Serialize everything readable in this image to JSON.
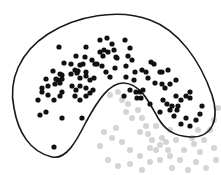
{
  "diagram": {
    "type": "scatter-with-enclosing-region",
    "background": "#ffffff",
    "outline_color": "#1a1a1a",
    "inside_dot_color": "#111111",
    "outside_dot_color": "#d4d4d4",
    "region_path": "M 14 108 C 8 80, 20 52, 48 34 C 76 16, 118 8, 150 20 C 178 30, 200 60, 212 95 C 220 120, 212 138, 190 137 C 172 136, 164 128, 158 118 C 148 100, 140 84, 124 83 C 110 82, 98 100, 86 122 C 76 142, 66 160, 52 157 C 30 152, 18 132, 14 108 Z",
    "inside_points": [
      [
        59,
        47
      ],
      [
        86,
        47
      ],
      [
        76,
        56
      ],
      [
        64,
        63
      ],
      [
        71,
        64
      ],
      [
        85,
        57
      ],
      [
        92,
        60
      ],
      [
        95,
        64
      ],
      [
        80,
        65
      ],
      [
        75,
        70
      ],
      [
        78,
        71
      ],
      [
        53,
        71
      ],
      [
        60,
        74
      ],
      [
        46,
        79
      ],
      [
        56,
        79
      ],
      [
        62,
        75
      ],
      [
        42,
        88
      ],
      [
        48,
        86
      ],
      [
        55,
        84
      ],
      [
        58,
        80
      ],
      [
        60,
        83
      ],
      [
        62,
        79
      ],
      [
        77,
        73
      ],
      [
        80,
        78
      ],
      [
        86,
        76
      ],
      [
        90,
        80
      ],
      [
        94,
        78
      ],
      [
        86,
        72
      ],
      [
        83,
        64
      ],
      [
        71,
        74
      ],
      [
        38,
        100
      ],
      [
        42,
        92
      ],
      [
        48,
        95
      ],
      [
        54,
        100
      ],
      [
        60,
        96
      ],
      [
        62,
        92
      ],
      [
        75,
        96
      ],
      [
        80,
        100
      ],
      [
        86,
        96
      ],
      [
        90,
        93
      ],
      [
        72,
        86
      ],
      [
        76,
        90
      ],
      [
        80,
        86
      ],
      [
        86,
        88
      ],
      [
        93,
        90
      ],
      [
        46,
        112
      ],
      [
        62,
        118
      ],
      [
        82,
        118
      ],
      [
        54,
        147
      ],
      [
        40,
        115
      ],
      [
        100,
        40
      ],
      [
        107,
        38
      ],
      [
        112,
        44
      ],
      [
        100,
        52
      ],
      [
        103,
        56
      ],
      [
        97,
        64
      ],
      [
        102,
        66
      ],
      [
        106,
        72
      ],
      [
        110,
        77
      ],
      [
        115,
        68
      ],
      [
        117,
        58
      ],
      [
        128,
        56
      ],
      [
        132,
        60
      ],
      [
        135,
        72
      ],
      [
        134,
        80
      ],
      [
        126,
        77
      ],
      [
        130,
        90
      ],
      [
        124,
        96
      ],
      [
        136,
        92
      ],
      [
        137,
        98
      ],
      [
        140,
        92
      ],
      [
        141,
        98
      ],
      [
        143,
        90
      ],
      [
        104,
        50
      ],
      [
        108,
        52
      ],
      [
        114,
        50
      ],
      [
        116,
        57
      ],
      [
        125,
        40
      ],
      [
        130,
        48
      ],
      [
        126,
        66
      ],
      [
        142,
        70
      ],
      [
        146,
        72
      ],
      [
        151,
        62
      ],
      [
        154,
        64
      ],
      [
        160,
        72
      ],
      [
        148,
        78
      ],
      [
        155,
        83
      ],
      [
        162,
        84
      ],
      [
        170,
        84
      ],
      [
        176,
        80
      ],
      [
        165,
        88
      ],
      [
        163,
        100
      ],
      [
        167,
        104
      ],
      [
        170,
        110
      ],
      [
        174,
        116
      ],
      [
        178,
        106
      ],
      [
        181,
        100
      ],
      [
        177,
        110
      ],
      [
        186,
        96
      ],
      [
        190,
        92
      ],
      [
        150,
        104
      ],
      [
        160,
        112
      ],
      [
        172,
        106
      ],
      [
        186,
        118
      ],
      [
        181,
        124
      ],
      [
        190,
        126
      ],
      [
        196,
        120
      ],
      [
        200,
        114
      ],
      [
        202,
        106
      ],
      [
        190,
        98
      ],
      [
        176,
        96
      ],
      [
        162,
        72
      ],
      [
        168,
        70
      ]
    ],
    "outside_points": [
      [
        110,
        95
      ],
      [
        118,
        92
      ],
      [
        122,
        100
      ],
      [
        128,
        104
      ],
      [
        126,
        112
      ],
      [
        132,
        118
      ],
      [
        138,
        110
      ],
      [
        142,
        118
      ],
      [
        146,
        126
      ],
      [
        148,
        134
      ],
      [
        152,
        140
      ],
      [
        150,
        148
      ],
      [
        156,
        150
      ],
      [
        160,
        145
      ],
      [
        162,
        138
      ],
      [
        166,
        142
      ],
      [
        170,
        130
      ],
      [
        176,
        140
      ],
      [
        184,
        150
      ],
      [
        194,
        144
      ],
      [
        200,
        152
      ],
      [
        204,
        140
      ],
      [
        210,
        130
      ],
      [
        214,
        148
      ],
      [
        216,
        160
      ],
      [
        206,
        168
      ],
      [
        196,
        162
      ],
      [
        180,
        160
      ],
      [
        170,
        156
      ],
      [
        160,
        160
      ],
      [
        150,
        162
      ],
      [
        140,
        156
      ],
      [
        130,
        150
      ],
      [
        122,
        142
      ],
      [
        112,
        138
      ],
      [
        116,
        128
      ],
      [
        104,
        132
      ],
      [
        100,
        146
      ],
      [
        108,
        160
      ],
      [
        118,
        166
      ],
      [
        130,
        164
      ],
      [
        142,
        170
      ],
      [
        172,
        168
      ],
      [
        188,
        170
      ],
      [
        214,
        120
      ],
      [
        218,
        108
      ],
      [
        156,
        126
      ],
      [
        140,
        132
      ],
      [
        168,
        150
      ],
      [
        198,
        130
      ],
      [
        192,
        138
      ]
    ]
  }
}
